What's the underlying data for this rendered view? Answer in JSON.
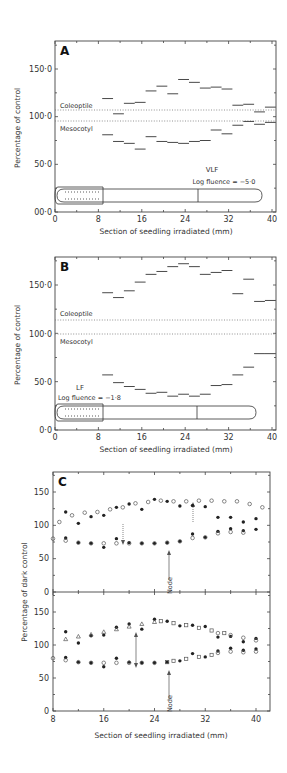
{
  "figure": {
    "panels": [
      {
        "id": "A",
        "label": "A"
      },
      {
        "id": "B",
        "label": "B"
      },
      {
        "id": "C",
        "label": "C"
      }
    ]
  },
  "chart_data": [
    {
      "type": "line",
      "panel": "A",
      "title": "A",
      "xlabel": "Section of seedling irradiated (mm)",
      "ylabel": "Percentage of control",
      "xlim": [
        0,
        40
      ],
      "ylim": [
        0,
        180
      ],
      "xticks": [
        "0",
        "8",
        "16",
        "24",
        "32",
        "40"
      ],
      "yticks": [
        "00·0",
        "50·0",
        "100·0",
        "150·0"
      ],
      "annotations": [
        "Coleoptile",
        "Mesocotyl",
        "VLF",
        "Log fluence = −5·0"
      ],
      "reference_lines": {
        "coleoptile": 106,
        "mesocotyl": 95
      },
      "segment_width_mm": 2,
      "x_start_mm": [
        9,
        11,
        13,
        15,
        17,
        19,
        21,
        23,
        25,
        27,
        29,
        31,
        33,
        35,
        37,
        39
      ],
      "series": [
        {
          "name": "Coleoptile",
          "values": [
            119,
            103,
            114,
            115,
            127,
            132,
            124,
            139,
            136,
            130,
            131,
            129,
            112,
            113,
            105,
            110
          ]
        },
        {
          "name": "Mesocotyl",
          "values": [
            81,
            74,
            72,
            66,
            79,
            74,
            73,
            72,
            74,
            75,
            86,
            82,
            91,
            95,
            92,
            94
          ]
        }
      ]
    },
    {
      "type": "line",
      "panel": "B",
      "title": "B",
      "xlabel": "Section of seedling irradiated (mm)",
      "ylabel": "Percentage of control",
      "xlim": [
        0,
        40
      ],
      "ylim": [
        0,
        180
      ],
      "xticks": [
        "0",
        "8",
        "16",
        "24",
        "32",
        "40"
      ],
      "yticks": [
        "0·0",
        "50·0",
        "100·0",
        "150·0"
      ],
      "annotations": [
        "Coleoptile",
        "Mesocotyl",
        "LF",
        "Log fluence = −1·8"
      ],
      "reference_lines": {
        "coleoptile": 114,
        "mesocotyl": 100
      },
      "segment_width_mm": 2,
      "x_start_mm": [
        9,
        11,
        13,
        15,
        17,
        19,
        21,
        23,
        25,
        27,
        29,
        31,
        33,
        35,
        37,
        39
      ],
      "series": [
        {
          "name": "Coleoptile",
          "values": [
            142,
            137,
            144,
            153,
            161,
            164,
            169,
            172,
            169,
            161,
            163,
            165,
            141,
            156,
            133,
            134
          ]
        },
        {
          "name": "Mesocotyl",
          "values": [
            57,
            49,
            45,
            42,
            38,
            39,
            35,
            37,
            35,
            37,
            46,
            47,
            57,
            65,
            79,
            79
          ]
        }
      ]
    },
    {
      "type": "scatter",
      "panel": "C-upper",
      "title": "C",
      "xlabel": "",
      "ylabel": "Percentage of dark control",
      "xlim": [
        8,
        41
      ],
      "ylim": [
        0,
        180
      ],
      "yticks": [
        "0",
        "50",
        "100",
        "150"
      ],
      "annotations": [
        "Node"
      ],
      "series": [
        {
          "name": "filled-upper",
          "marker": "filled-circle",
          "x": [
            10,
            12,
            14,
            16,
            18,
            20,
            22,
            24,
            26,
            28,
            30,
            32,
            34,
            36,
            38,
            40
          ],
          "values": [
            120,
            103,
            113,
            115,
            127,
            132,
            124,
            139,
            136,
            129,
            130,
            128,
            112,
            112,
            105,
            110
          ]
        },
        {
          "name": "open-upper",
          "marker": "open-circle",
          "x": [
            9,
            11,
            13,
            15,
            17,
            19,
            21,
            23,
            25,
            27,
            29,
            31,
            33,
            35,
            37,
            39,
            41
          ],
          "values": [
            105,
            115,
            119,
            120,
            124,
            127,
            133,
            135,
            137,
            136,
            136,
            137,
            137,
            136,
            136,
            132,
            127
          ]
        },
        {
          "name": "filled-lower",
          "marker": "filled-circle",
          "x": [
            10,
            12,
            14,
            16,
            18,
            20,
            22,
            24,
            26,
            28,
            30,
            32,
            34,
            36,
            38,
            40
          ],
          "values": [
            81,
            74,
            73,
            67,
            80,
            74,
            73,
            73,
            74,
            76,
            87,
            82,
            91,
            95,
            92,
            94
          ]
        },
        {
          "name": "open-lower",
          "marker": "open-circle",
          "x": [
            8,
            10,
            12,
            14,
            16,
            18,
            20,
            22,
            24,
            26,
            28,
            30,
            32,
            34,
            36,
            38
          ],
          "values": [
            80,
            77,
            74,
            73,
            73,
            73,
            73,
            73,
            73,
            74,
            76,
            81,
            82,
            88,
            90,
            89
          ]
        }
      ]
    },
    {
      "type": "scatter",
      "panel": "C-lower",
      "xlabel": "Section of seedling irradiated (mm)",
      "ylabel": "Percentage of dark control",
      "xlim": [
        8,
        41
      ],
      "ylim": [
        0,
        180
      ],
      "xticks": [
        "8",
        "16",
        "24",
        "32",
        "40"
      ],
      "yticks": [
        "0",
        "50",
        "100",
        "150"
      ],
      "annotations": [
        "Node"
      ],
      "series": [
        {
          "name": "filled-upper",
          "marker": "filled-circle",
          "x": [
            10,
            12,
            14,
            16,
            18,
            20,
            22,
            24,
            26,
            28,
            30,
            32,
            34,
            36,
            38,
            40
          ],
          "values": [
            120,
            103,
            114,
            115,
            127,
            132,
            124,
            139,
            136,
            129,
            130,
            128,
            112,
            113,
            105,
            110
          ]
        },
        {
          "name": "triangle-upper",
          "marker": "open-triangle",
          "x": [
            10,
            12,
            14,
            16,
            18,
            20,
            22,
            24
          ],
          "values": [
            109,
            113,
            116,
            120,
            124,
            128,
            132,
            135
          ]
        },
        {
          "name": "square-upper",
          "marker": "open-square",
          "x": [
            25,
            27,
            29,
            31,
            33,
            35
          ],
          "values": [
            136,
            133,
            130,
            126,
            122,
            118
          ]
        },
        {
          "name": "open-circle-upper",
          "marker": "open-circle",
          "x": [
            34,
            36,
            38,
            40
          ],
          "values": [
            118,
            115,
            111,
            107
          ]
        },
        {
          "name": "filled-lower",
          "marker": "filled-circle",
          "x": [
            10,
            12,
            14,
            16,
            18,
            20,
            22,
            24,
            26,
            28,
            30,
            32,
            34,
            36,
            38,
            40
          ],
          "values": [
            81,
            74,
            73,
            67,
            80,
            74,
            73,
            73,
            74,
            76,
            87,
            82,
            91,
            95,
            92,
            94
          ]
        },
        {
          "name": "open-circle-lower",
          "marker": "open-circle",
          "x": [
            8,
            10,
            12,
            14,
            16,
            18,
            20,
            22,
            24,
            34,
            36,
            38,
            40
          ],
          "values": [
            80,
            77,
            74,
            73,
            73,
            73,
            73,
            73,
            73,
            88,
            90,
            89,
            90
          ]
        },
        {
          "name": "square-lower",
          "marker": "open-square",
          "x": [
            26,
            27,
            29,
            31,
            33
          ],
          "values": [
            74,
            76,
            79,
            82,
            85
          ]
        }
      ]
    }
  ],
  "labels": {
    "panelA": {
      "letter": "A",
      "y150": "150·0",
      "y100": "100·0",
      "y50": "50·0",
      "y0": "00·0",
      "coleoptile": "Coleoptile",
      "mesocotyl": "Mesocotyl",
      "treat": "VLF",
      "fluence": "Log fluence = −5·0"
    },
    "panelB": {
      "letter": "B",
      "y150": "150·0",
      "y100": "100·0",
      "y50": "50·0",
      "y0": "0·0",
      "coleoptile": "Coleoptile",
      "mesocotyl": "Mesocotyl",
      "treat": "LF",
      "fluence": "Log fluence = −1·8"
    },
    "panelC": {
      "letter": "C",
      "y150": "150",
      "y100": "100",
      "y50": "50",
      "y0": "0",
      "node": "Node"
    },
    "xticksAB": [
      "0",
      "8",
      "16",
      "24",
      "32",
      "40"
    ],
    "xticksC": [
      "8",
      "16",
      "24",
      "32",
      "40"
    ],
    "xlabel": "Section of seedling irradiated (mm)",
    "ylabelAB": "Percentage of control",
    "ylabelC": "Percentage of dark control"
  }
}
